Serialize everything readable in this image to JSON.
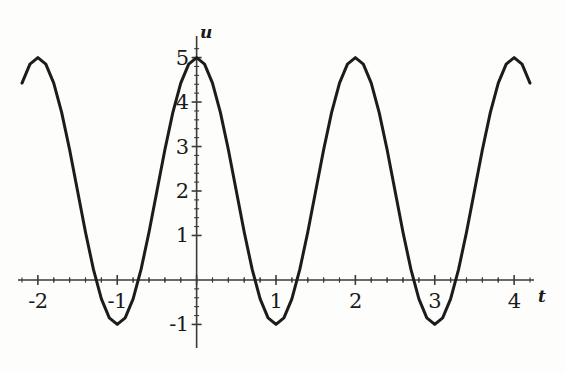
{
  "chart_data": {
    "type": "line",
    "title": "",
    "subtitle": "",
    "xlabel": "t",
    "ylabel": "u",
    "xlim": [
      -2.2,
      4.2
    ],
    "ylim": [
      -1.35,
      5.35
    ],
    "grid": false,
    "legend": null,
    "axis_style": "crossed-axes-at-origin",
    "function": "u = 2 + 3 cos(pi t)",
    "amplitude": 3,
    "midline": 2,
    "period": 2,
    "maximum": 5,
    "minimum": -1,
    "xticks": [
      -2,
      -1,
      1,
      2,
      3,
      4
    ],
    "xticklabels": [
      "-2",
      "-1",
      "1",
      "2",
      "3",
      "4"
    ],
    "yticks": [
      1,
      2,
      3,
      4,
      5,
      -1
    ],
    "yticklabels": [
      "1",
      "2",
      "3",
      "4",
      "5",
      "-1"
    ],
    "minor_tick_count_per_interval": 4,
    "series": [
      {
        "name": "u(t)",
        "color": "#1c1c1c",
        "linewidth": 3,
        "points": [
          {
            "t": -2.2,
            "u": 4.427
          },
          {
            "t": -2.1,
            "u": 4.854
          },
          {
            "t": -2.0,
            "u": 5.0
          },
          {
            "t": -1.9,
            "u": 4.854
          },
          {
            "t": -1.8,
            "u": 4.427
          },
          {
            "t": -1.7,
            "u": 3.763
          },
          {
            "t": -1.6,
            "u": 2.927
          },
          {
            "t": -1.5,
            "u": 2.0
          },
          {
            "t": -1.4,
            "u": 1.073
          },
          {
            "t": -1.3,
            "u": 0.237
          },
          {
            "t": -1.2,
            "u": -0.427
          },
          {
            "t": -1.1,
            "u": -0.854
          },
          {
            "t": -1.0,
            "u": -1.0
          },
          {
            "t": -0.9,
            "u": -0.854
          },
          {
            "t": -0.8,
            "u": -0.427
          },
          {
            "t": -0.7,
            "u": 0.237
          },
          {
            "t": -0.6,
            "u": 1.073
          },
          {
            "t": -0.5,
            "u": 2.0
          },
          {
            "t": -0.4,
            "u": 2.927
          },
          {
            "t": -0.3,
            "u": 3.763
          },
          {
            "t": -0.2,
            "u": 4.427
          },
          {
            "t": -0.1,
            "u": 4.854
          },
          {
            "t": 0.0,
            "u": 5.0
          },
          {
            "t": 0.1,
            "u": 4.854
          },
          {
            "t": 0.2,
            "u": 4.427
          },
          {
            "t": 0.3,
            "u": 3.763
          },
          {
            "t": 0.4,
            "u": 2.927
          },
          {
            "t": 0.5,
            "u": 2.0
          },
          {
            "t": 0.6,
            "u": 1.073
          },
          {
            "t": 0.7,
            "u": 0.237
          },
          {
            "t": 0.8,
            "u": -0.427
          },
          {
            "t": 0.9,
            "u": -0.854
          },
          {
            "t": 1.0,
            "u": -1.0
          },
          {
            "t": 1.1,
            "u": -0.854
          },
          {
            "t": 1.2,
            "u": -0.427
          },
          {
            "t": 1.3,
            "u": 0.237
          },
          {
            "t": 1.4,
            "u": 1.073
          },
          {
            "t": 1.5,
            "u": 2.0
          },
          {
            "t": 1.6,
            "u": 2.927
          },
          {
            "t": 1.7,
            "u": 3.763
          },
          {
            "t": 1.8,
            "u": 4.427
          },
          {
            "t": 1.9,
            "u": 4.854
          },
          {
            "t": 2.0,
            "u": 5.0
          },
          {
            "t": 2.1,
            "u": 4.854
          },
          {
            "t": 2.2,
            "u": 4.427
          },
          {
            "t": 2.3,
            "u": 3.763
          },
          {
            "t": 2.4,
            "u": 2.927
          },
          {
            "t": 2.5,
            "u": 2.0
          },
          {
            "t": 2.6,
            "u": 1.073
          },
          {
            "t": 2.7,
            "u": 0.237
          },
          {
            "t": 2.8,
            "u": -0.427
          },
          {
            "t": 2.9,
            "u": -0.854
          },
          {
            "t": 3.0,
            "u": -1.0
          },
          {
            "t": 3.1,
            "u": -0.854
          },
          {
            "t": 3.2,
            "u": -0.427
          },
          {
            "t": 3.3,
            "u": 0.237
          },
          {
            "t": 3.4,
            "u": 1.073
          },
          {
            "t": 3.5,
            "u": 2.0
          },
          {
            "t": 3.6,
            "u": 2.927
          },
          {
            "t": 3.7,
            "u": 3.763
          },
          {
            "t": 3.8,
            "u": 4.427
          },
          {
            "t": 3.9,
            "u": 4.854
          },
          {
            "t": 4.0,
            "u": 5.0
          },
          {
            "t": 4.1,
            "u": 4.854
          },
          {
            "t": 4.2,
            "u": 4.427
          }
        ]
      }
    ]
  },
  "axes": {
    "x_axis_name": "t",
    "y_axis_name": "u"
  },
  "colors": {
    "curve": "#1c1c1c",
    "axis": "#3a3a3a",
    "text": "#1a1a1a",
    "background": "#fdfdfc"
  }
}
